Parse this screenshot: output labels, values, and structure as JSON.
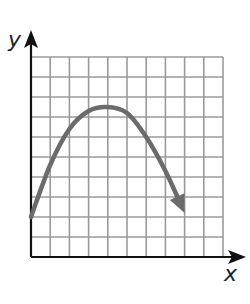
{
  "chart_data": {
    "type": "line",
    "title": "",
    "xlabel": "x",
    "ylabel": "y",
    "grid": true,
    "xlim": [
      0,
      10
    ],
    "ylim": [
      0,
      10
    ],
    "grid_cells": {
      "columns": 10,
      "rows": 10
    },
    "tick_labels": {
      "x": [],
      "y": []
    },
    "series": [
      {
        "name": "curve",
        "shape": "downward parabola with arrow at right end",
        "x": [
          0,
          1,
          2,
          3,
          4,
          5,
          6,
          7,
          8
        ],
        "y": [
          2,
          4.6,
          6.4,
          7.3,
          7.5,
          7.2,
          6.0,
          4.3,
          2.2
        ],
        "start_point": [
          0,
          2
        ],
        "vertex": [
          4,
          7.5
        ],
        "end_arrow": [
          8,
          2.2
        ]
      }
    ],
    "colors": {
      "curve": "#6b6b6b",
      "grid": "#9a9a9a",
      "axes": "#111111"
    }
  }
}
